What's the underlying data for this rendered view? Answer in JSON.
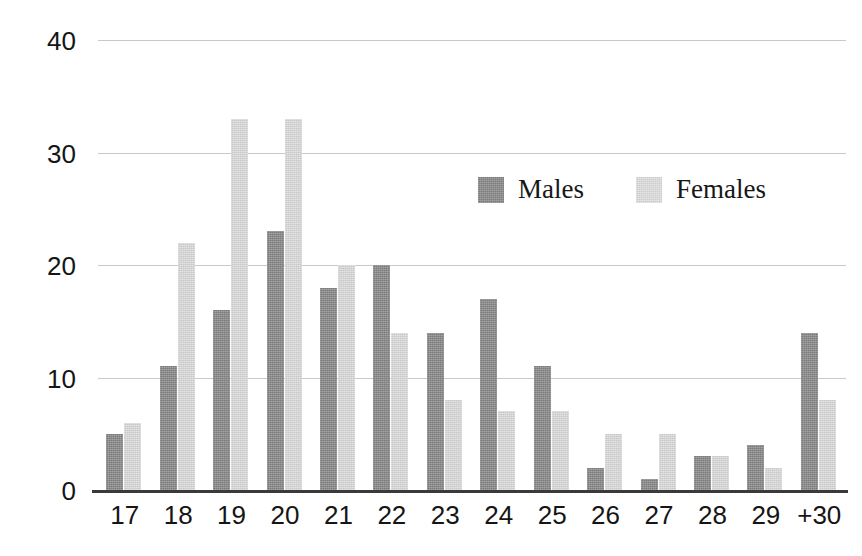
{
  "chart_data": {
    "type": "bar",
    "title": "",
    "subtitle": "",
    "xlabel": "",
    "ylabel": "",
    "ylim": [
      0,
      40
    ],
    "yticks": [
      0,
      10,
      20,
      30,
      40
    ],
    "grid": true,
    "legend_position": "inside-upper-center",
    "categories": [
      "17",
      "18",
      "19",
      "20",
      "21",
      "22",
      "23",
      "24",
      "25",
      "26",
      "27",
      "28",
      "29",
      "+30"
    ],
    "series": [
      {
        "name": "Males",
        "color": "#7b7b7b",
        "values": [
          5,
          11,
          16,
          23,
          18,
          20,
          14,
          17,
          11,
          2,
          1,
          3,
          4,
          14
        ]
      },
      {
        "name": "Females",
        "color": "#c9c9c9",
        "values": [
          6,
          22,
          33,
          33,
          20,
          14,
          8,
          7,
          7,
          5,
          5,
          3,
          2,
          8
        ]
      }
    ]
  },
  "axis": {
    "y_tick_labels": [
      "40",
      "30",
      "20",
      "10",
      "0"
    ],
    "x_tick_labels": [
      "17",
      "18",
      "19",
      "20",
      "21",
      "22",
      "23",
      "24",
      "25",
      "26",
      "27",
      "28",
      "29",
      "+30"
    ]
  },
  "legend": {
    "entries": [
      {
        "label": "Males",
        "swatch": "male-swatch"
      },
      {
        "label": "Females",
        "swatch": "female-swatch"
      }
    ]
  },
  "colors": {
    "male_bar": "#7b7b7b",
    "female_bar": "#c9c9c9",
    "gridline": "#c9c9c9",
    "axis_line": "#3a3a3a",
    "text": "#151515",
    "background": "#ffffff"
  }
}
